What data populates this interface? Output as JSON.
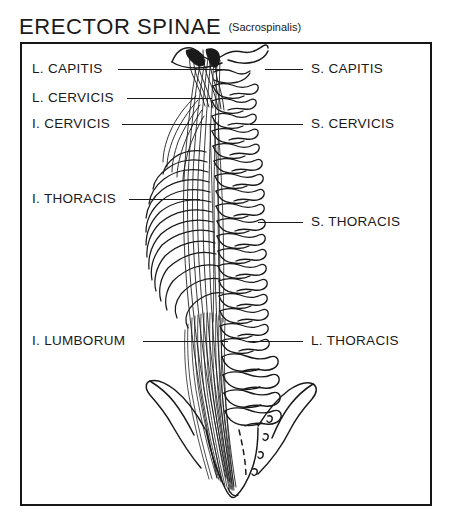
{
  "title": {
    "main": "ERECTOR SPINAE",
    "sub": "(Sacrospinalis)"
  },
  "labels": {
    "left": [
      {
        "id": "l-capitis",
        "text": "L. CAPITIS",
        "x": 32,
        "y": 62,
        "line_x1": 118,
        "line_x2": 222,
        "line_y": 69
      },
      {
        "id": "l-cervicis",
        "text": "L. CERVICIS",
        "x": 32,
        "y": 91,
        "line_x1": 127,
        "line_x2": 212,
        "line_y": 98
      },
      {
        "id": "i-cervicis",
        "text": "I. CERVICIS",
        "x": 32,
        "y": 117,
        "line_x1": 122,
        "line_x2": 216,
        "line_y": 124
      },
      {
        "id": "i-thoracis",
        "text": "I. THORACIS",
        "x": 32,
        "y": 192,
        "line_x1": 129,
        "line_x2": 200,
        "line_y": 199
      },
      {
        "id": "i-lumborum",
        "text": "I. LUMBORUM",
        "x": 32,
        "y": 334,
        "line_x1": 143,
        "line_x2": 228,
        "line_y": 341
      }
    ],
    "right": [
      {
        "id": "s-capitis",
        "text": "S. CAPITIS",
        "x": 311,
        "y": 62,
        "line_x1": 265,
        "line_x2": 303,
        "line_y": 69
      },
      {
        "id": "s-cervicis",
        "text": "S. CERVICIS",
        "x": 311,
        "y": 117,
        "line_x1": 250,
        "line_x2": 303,
        "line_y": 124
      },
      {
        "id": "s-thoracis",
        "text": "S. THORACIS",
        "x": 311,
        "y": 215,
        "line_x1": 258,
        "line_x2": 303,
        "line_y": 222
      },
      {
        "id": "l-thoracis",
        "text": "L. THORACIS",
        "x": 311,
        "y": 334,
        "line_x1": 248,
        "line_x2": 303,
        "line_y": 341
      }
    ]
  },
  "colors": {
    "ink": "#1a1a1a",
    "frame": "#161616",
    "paper": "#ffffff"
  },
  "illustration": {
    "name": "erector-spinae-anatomical-drawing",
    "description": "Posterior view of vertebral column with ribs, occiput, sacrum and erector spinae muscle fibers"
  }
}
